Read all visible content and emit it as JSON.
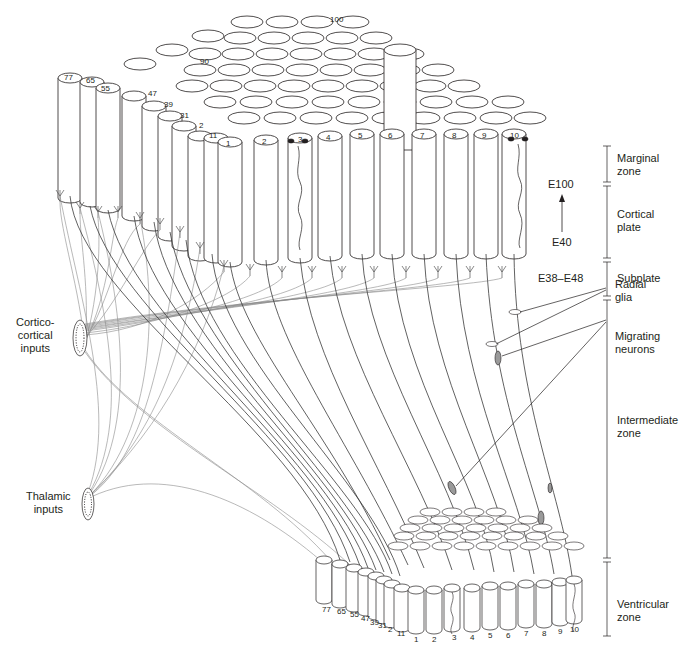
{
  "figure": {
    "colors": {
      "background": "#ffffff",
      "column_fill": "#ffffff",
      "column_stroke": "#231f20",
      "fiber_dark": "#3a3a3a",
      "fiber_gray": "#8a8a8a",
      "neuron_fill": "#9a9a9a"
    }
  },
  "top_column_labels": {
    "front_row": [
      "1",
      "2",
      "3",
      "4",
      "5",
      "6",
      "7",
      "8",
      "9",
      "10"
    ],
    "diagonal": [
      "11",
      "2",
      "31",
      "39",
      "47",
      "55",
      "65",
      "77"
    ],
    "back": [
      "90",
      "100"
    ]
  },
  "bottom_column_labels": {
    "front_row": [
      "1",
      "2",
      "3",
      "4",
      "5",
      "6",
      "7",
      "8",
      "9",
      "10"
    ],
    "diagonal": [
      "11",
      "2",
      "31",
      "39",
      "47",
      "55",
      "65",
      "77"
    ]
  },
  "zones": [
    {
      "id": "marginal",
      "line1": "Marginal",
      "line2": "zone"
    },
    {
      "id": "cortical-plate",
      "line1": "Cortical",
      "line2": "plate"
    },
    {
      "id": "subplate",
      "line1": "Subplate",
      "line2": ""
    },
    {
      "id": "intermediate",
      "line1": "Intermediate",
      "line2": "zone"
    },
    {
      "id": "ventricular",
      "line1": "Ventricular",
      "line2": "zone"
    }
  ],
  "time_labels": {
    "top": "E100",
    "bottom": "E40",
    "subplate": "E38–E48"
  },
  "annotations": {
    "radial_glia": {
      "line1": "Radial",
      "line2": "glia"
    },
    "migrating_neurons": {
      "line1": "Migrating",
      "line2": "neurons"
    }
  },
  "inputs": {
    "corticocortical": {
      "line1": "Cortico-",
      "line2": "cortical",
      "line3": "inputs"
    },
    "thalamic": {
      "line1": "Thalamic",
      "line2": "inputs"
    }
  }
}
